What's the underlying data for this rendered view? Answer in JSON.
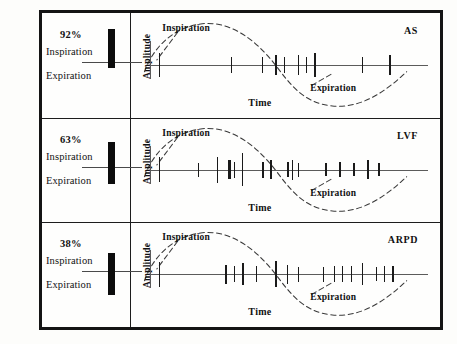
{
  "figure": {
    "axis": {
      "xlabel": "Time",
      "ylabel": "Amplitude"
    },
    "annotations": {
      "inspiration": "Inspiration",
      "expiration": "Expiration"
    },
    "colors": {
      "ink": "#111111",
      "frame": "#141414",
      "axis": "#5b5b5b",
      "wave": "#3a3a3a",
      "bar": "#0c0c0c",
      "paper": "#fdfdfb"
    }
  },
  "chart_data": {
    "type": "scatter",
    "xlabel": "Time",
    "ylabel": "Amplitude",
    "xlim": [
      0,
      100
    ],
    "ylim": [
      -1,
      1
    ],
    "grid": false,
    "legend": "none",
    "waveform": {
      "description": "dashed sinusoid, one cycle across the time axis",
      "inspiration_fraction": 0.55,
      "peak_x": 30,
      "trough_x": 82
    },
    "panels": [
      {
        "label": "AS",
        "percent_inspiration": "92%",
        "percent_value": 92,
        "bar_above_fraction": 0.92,
        "spikes_x": [
          3,
          3,
          29,
          40,
          45,
          48,
          53,
          56,
          59,
          76,
          86
        ],
        "spikes_height": [
          0.95,
          0.95,
          0.62,
          0.62,
          0.75,
          0.62,
          0.78,
          0.62,
          0.9,
          0.62,
          0.8
        ],
        "spikes_weight": [
          1.3,
          1.3,
          1.3,
          1.3,
          1.3,
          1.3,
          1.3,
          1.3,
          1.3,
          1.3,
          1.3
        ]
      },
      {
        "label": "LVF",
        "percent_inspiration": "63%",
        "percent_value": 63,
        "bar_above_fraction": 0.63,
        "spikes_x": [
          3,
          3,
          17,
          24,
          28,
          30,
          33,
          40,
          43,
          49,
          51,
          53,
          63,
          68,
          73,
          78,
          82
        ],
        "spikes_height": [
          0.95,
          0.95,
          0.55,
          1.0,
          0.75,
          0.62,
          1.25,
          0.62,
          0.72,
          0.6,
          0.78,
          0.55,
          0.52,
          0.6,
          0.5,
          0.72,
          0.5
        ],
        "spikes_weight": [
          1.3,
          1.3,
          1.3,
          1.3,
          2.6,
          1.3,
          1.3,
          2.6,
          2.3,
          2.8,
          1.3,
          1.3,
          1.3,
          1.6,
          1.3,
          2.3,
          1.3
        ]
      },
      {
        "label": "ARPD",
        "percent_inspiration": "38%",
        "percent_value": 38,
        "bar_above_fraction": 0.38,
        "spikes_x": [
          3,
          3,
          27,
          30,
          33,
          38,
          45,
          49,
          53,
          62,
          66,
          69,
          72,
          76,
          81,
          84,
          87
        ],
        "spikes_height": [
          0.95,
          0.95,
          0.72,
          0.62,
          0.85,
          0.62,
          1.0,
          0.75,
          0.6,
          0.6,
          0.62,
          0.62,
          0.62,
          0.85,
          0.55,
          0.62,
          0.62
        ],
        "spikes_weight": [
          1.3,
          1.3,
          1.6,
          1.3,
          1.6,
          1.3,
          1.6,
          1.3,
          1.3,
          1.3,
          1.3,
          1.3,
          1.3,
          1.6,
          1.3,
          1.3,
          1.3
        ]
      }
    ]
  }
}
